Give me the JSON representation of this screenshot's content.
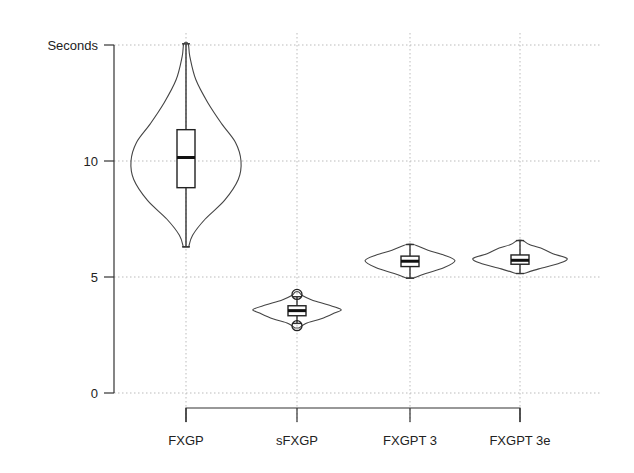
{
  "chart_data": {
    "type": "violin",
    "title": "",
    "xlabel": "",
    "ylabel": "Seconds",
    "ylim": [
      0,
      15
    ],
    "yticks": [
      {
        "value": 0,
        "label": "0"
      },
      {
        "value": 5,
        "label": "5"
      },
      {
        "value": 10,
        "label": "10"
      },
      {
        "value": 15,
        "label": "Seconds"
      }
    ],
    "grid": true,
    "categories": [
      "FXGP",
      "sFXGP",
      "FXGPT 3",
      "FXGPT 3e"
    ],
    "series": [
      {
        "name": "FXGP",
        "min": 6.3,
        "q1": 8.85,
        "median": 10.15,
        "q3": 11.35,
        "max": 15.05,
        "outliers": [],
        "density": [
          [
            6.3,
            0.05
          ],
          [
            6.8,
            0.12
          ],
          [
            7.5,
            0.35
          ],
          [
            8.3,
            0.7
          ],
          [
            9.2,
            0.95
          ],
          [
            10.0,
            1.0
          ],
          [
            10.8,
            0.9
          ],
          [
            11.6,
            0.65
          ],
          [
            12.5,
            0.4
          ],
          [
            13.5,
            0.18
          ],
          [
            14.5,
            0.07
          ],
          [
            15.05,
            0.04
          ]
        ]
      },
      {
        "name": "sFXGP",
        "min": 3.0,
        "q1": 3.33,
        "median": 3.55,
        "q3": 3.76,
        "max": 4.15,
        "outliers": [
          4.25,
          2.9
        ],
        "density": [
          [
            2.8,
            0.05
          ],
          [
            3.0,
            0.2
          ],
          [
            3.2,
            0.55
          ],
          [
            3.45,
            0.85
          ],
          [
            3.6,
            1.0
          ],
          [
            3.8,
            0.7
          ],
          [
            4.0,
            0.35
          ],
          [
            4.2,
            0.12
          ],
          [
            4.35,
            0.04
          ]
        ]
      },
      {
        "name": "FXGPT 3",
        "min": 4.95,
        "q1": 5.45,
        "median": 5.68,
        "q3": 5.9,
        "max": 6.4,
        "outliers": [],
        "density": [
          [
            4.95,
            0.08
          ],
          [
            5.15,
            0.35
          ],
          [
            5.4,
            0.75
          ],
          [
            5.7,
            1.0
          ],
          [
            5.95,
            0.75
          ],
          [
            6.15,
            0.4
          ],
          [
            6.4,
            0.08
          ]
        ]
      },
      {
        "name": "FXGPT 3e",
        "min": 5.15,
        "q1": 5.55,
        "median": 5.72,
        "q3": 5.95,
        "max": 6.57,
        "outliers": [],
        "density": [
          [
            5.15,
            0.08
          ],
          [
            5.35,
            0.4
          ],
          [
            5.6,
            0.85
          ],
          [
            5.8,
            1.0
          ],
          [
            6.0,
            0.7
          ],
          [
            6.2,
            0.5
          ],
          [
            6.4,
            0.2
          ],
          [
            6.57,
            0.06
          ]
        ]
      }
    ]
  }
}
